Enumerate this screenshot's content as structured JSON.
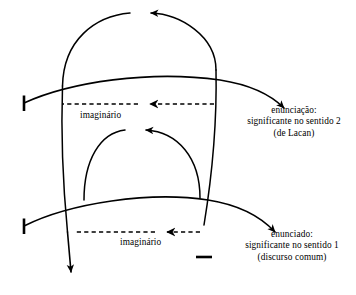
{
  "diagram": {
    "stroke_color": "#000000",
    "background_color": "#ffffff",
    "labels": {
      "imaginario_upper": "imaginário",
      "imaginario_lower": "imaginário",
      "enunciacao": {
        "line1": "enunciação:",
        "line2": "significante no sentido 2",
        "line3": "(de Lacan)"
      },
      "enunciado": {
        "line1": "enunciado:",
        "line2": "significante no sentido 1",
        "line3": "(discurso comum)"
      }
    },
    "elements": {
      "upper_curve": "curva da enunciação",
      "lower_curve": "curva do enunciado",
      "outer_loop": "vetor retroativo externo",
      "inner_loop": "vetor retroativo interno",
      "upper_dashed_arrow": "seta tracejada imaginário superior",
      "lower_dashed_arrow": "seta tracejada imaginário inferior",
      "down_arrow": "seta descendente",
      "tick_left_upper": "marca terminal esquerda superior",
      "tick_left_lower": "marca terminal esquerda inferior",
      "tick_bottom_right": "marca terminal inferior direita"
    }
  }
}
